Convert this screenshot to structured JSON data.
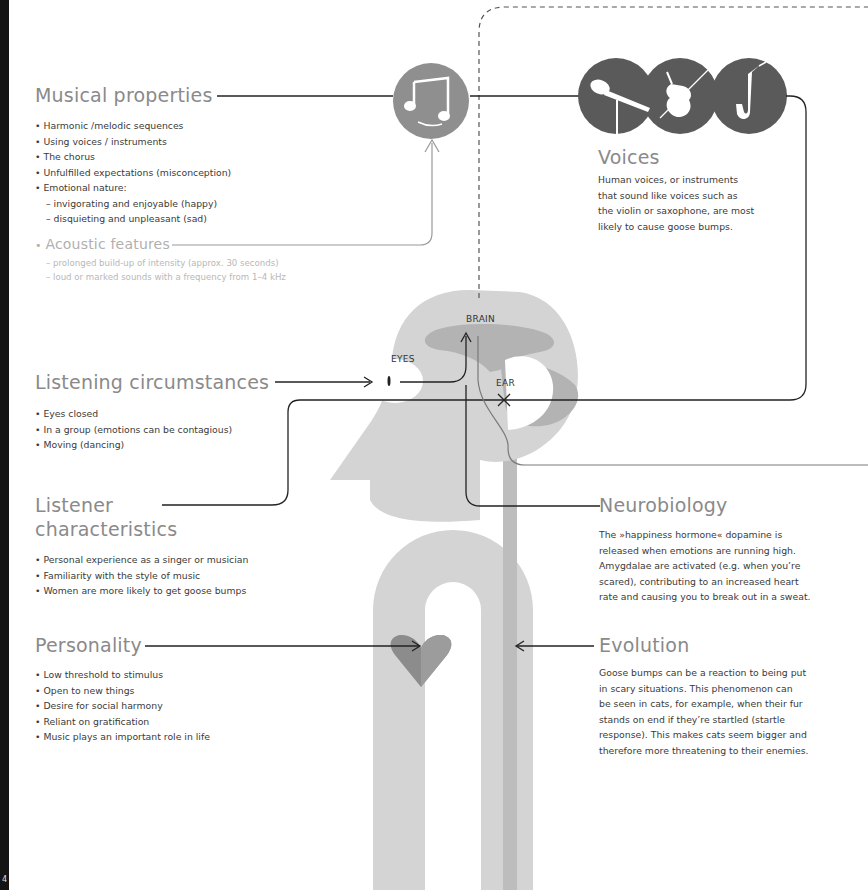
{
  "page": {
    "number": "4"
  },
  "musical_properties": {
    "title": "Musical properties",
    "items": [
      {
        "type": "bullet",
        "text": "Harmonic /melodic sequences"
      },
      {
        "type": "bullet",
        "text": "Using voices / instruments"
      },
      {
        "type": "bullet",
        "text": "The chorus"
      },
      {
        "type": "bullet",
        "text": "Unfulfilled expectations (misconception)"
      },
      {
        "type": "bullet",
        "text": "Emotional nature:"
      },
      {
        "type": "dash",
        "text": "invigorating and enjoyable (happy)"
      },
      {
        "type": "dash",
        "text": "disquieting and unpleasant (sad)"
      }
    ]
  },
  "acoustic_features": {
    "title": "Acoustic features",
    "items": [
      "prolonged build-up of intensity (approx. 30 seconds)",
      "loud or marked sounds with a frequency from 1–4 kHz"
    ]
  },
  "voices": {
    "title": "Voices",
    "text_lines": [
      "Human voices, or instruments",
      "that sound like voices such as",
      "the violin or saxophone, are most",
      "likely to cause goose bumps."
    ],
    "icons": [
      "microphone-icon",
      "violin-icon",
      "saxophone-icon"
    ]
  },
  "listening_circumstances": {
    "title": "Listening circumstances",
    "items": [
      "Eyes closed",
      "In a group (emotions can be contagious)",
      "Moving (dancing)"
    ]
  },
  "listener_characteristics": {
    "title_line1": "Listener",
    "title_line2": "characteristics",
    "items": [
      "Personal experience as a singer or musician",
      "Familiarity with the style of music",
      "Women are more likely to get goose bumps"
    ]
  },
  "personality": {
    "title": "Personality",
    "items": [
      "Low threshold to stimulus",
      "Open to new things",
      "Desire for social harmony",
      "Reliant on gratification",
      "Music plays an important role in life"
    ]
  },
  "neurobiology": {
    "title": "Neurobiology",
    "text_lines": [
      "The »happiness hormone« dopamine is",
      "released when emotions are running high.",
      "Amygdalae are activated (e.g. when you’re",
      "scared), contributing to an increased heart",
      "rate and causing you to break out in a sweat."
    ]
  },
  "evolution": {
    "title": "Evolution",
    "text_lines": [
      "Goose bumps can be a reaction to being put",
      "in scary situations. This phenomenon can",
      "be seen in cats, for example, when their fur",
      "stands on end if they’re startled (startle",
      "response). This makes cats seem bigger and",
      "therefore more threatening to their enemies."
    ]
  },
  "head_labels": {
    "brain": "BRAIN",
    "eyes": "EYES",
    "ear": "EAR"
  },
  "colors": {
    "heading": "#8a8a8a",
    "body_text": "#3a3a3a",
    "light_text": "#b8b8b8",
    "head_light": "#d2d2d2",
    "head_mid": "#b4b4b4",
    "icon_dark": "#5a5a5a",
    "note_circle": "#8f8f8f",
    "heart": "#8c8c8c",
    "line": "#222222"
  }
}
